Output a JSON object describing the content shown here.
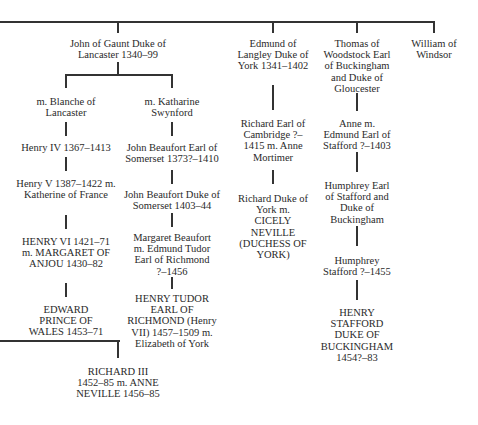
{
  "nodes": {
    "john_of_gaunt": "John of Gaunt Duke of Lancaster 1340–99",
    "blanche": "m. Blanche of Lancaster",
    "katharine": "m. Katharine Swynford",
    "henry_iv": "Henry IV 1367–1413",
    "henry_v": "Henry V 1387–1422  m. Katherine of France",
    "henry_vi": "HENRY VI 1421–71  m. MARGARET OF ANJOU 1430–82",
    "edward_prince": "EDWARD PRINCE OF WALES 1453–71",
    "john_beaufort_earl": "John Beaufort Earl of Somerset 1373?–1410",
    "john_beaufort_duke": "John Beaufort Duke of Somerset 1403–44",
    "margaret_beaufort": "Margaret Beaufort m. Edmund Tudor Earl of Richmond ?–1456",
    "henry_tudor": "HENRY TUDOR EARL OF RICHMOND (Henry VII) 1457–1509  m. Elizabeth of York",
    "edmund_langley": "Edmund of Langley Duke of York 1341–1402",
    "richard_cambridge": "Richard Earl of Cambridge ?–1415  m. Anne Mortimer",
    "richard_york": "Richard Duke of York m. CICELY NEVILLE (DUCHESS OF YORK)",
    "thomas_woodstock": "Thomas of Woodstock Earl of Buckingham and Duke of Gloucester",
    "anne": "Anne m. Edmund Earl of Stafford ?–1403",
    "humphrey_earl": "Humphrey Earl of Stafford and Duke of Buckingham",
    "humphrey_stafford": "Humphrey Stafford ?–1455",
    "henry_stafford": "HENRY STAFFORD DUKE OF BUCKINGHAM 1454?–83",
    "william_windsor": "William of Windsor",
    "richard_iii": "RICHARD III 1452–85  m. ANNE NEVILLE 1456–85"
  },
  "colors": {
    "line": "#333333",
    "text": "#2a2a2a",
    "background": "#ffffff"
  }
}
